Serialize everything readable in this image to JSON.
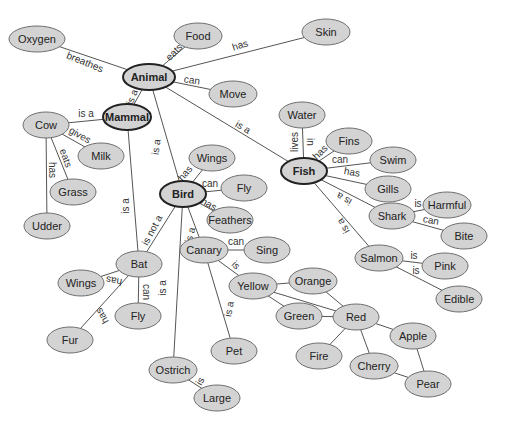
{
  "diagram": {
    "type": "concept-map",
    "colors": {
      "node_fill": "#d3d3d3",
      "node_stroke": "#6e6e6e",
      "main_stroke": "#222222",
      "edge": "#555555"
    },
    "nodes": [
      {
        "id": "oxygen",
        "label": "Oxygen",
        "x": 37,
        "y": 39,
        "rx": 28,
        "ry": 13
      },
      {
        "id": "food",
        "label": "Food",
        "x": 198,
        "y": 36,
        "rx": 24,
        "ry": 13
      },
      {
        "id": "skin",
        "label": "Skin",
        "x": 326,
        "y": 32,
        "rx": 24,
        "ry": 13
      },
      {
        "id": "animal",
        "label": "Animal",
        "x": 149,
        "y": 77,
        "rx": 26,
        "ry": 13,
        "main": true
      },
      {
        "id": "move",
        "label": "Move",
        "x": 233,
        "y": 94,
        "rx": 24,
        "ry": 13
      },
      {
        "id": "mammal",
        "label": "Mammal",
        "x": 127,
        "y": 117,
        "rx": 24,
        "ry": 13,
        "main": true
      },
      {
        "id": "cow",
        "label": "Cow",
        "x": 46,
        "y": 125,
        "rx": 23,
        "ry": 13
      },
      {
        "id": "milk",
        "label": "Milk",
        "x": 101,
        "y": 156,
        "rx": 23,
        "ry": 13
      },
      {
        "id": "grass",
        "label": "Grass",
        "x": 73,
        "y": 192,
        "rx": 23,
        "ry": 13
      },
      {
        "id": "udder",
        "label": "Udder",
        "x": 47,
        "y": 226,
        "rx": 23,
        "ry": 13
      },
      {
        "id": "water",
        "label": "Water",
        "x": 302,
        "y": 115,
        "rx": 23,
        "ry": 13
      },
      {
        "id": "fins",
        "label": "Fins",
        "x": 349,
        "y": 141,
        "rx": 23,
        "ry": 13
      },
      {
        "id": "swim",
        "label": "Swim",
        "x": 393,
        "y": 160,
        "rx": 23,
        "ry": 13
      },
      {
        "id": "fish",
        "label": "Fish",
        "x": 304,
        "y": 171,
        "rx": 23,
        "ry": 13,
        "main": true
      },
      {
        "id": "gills",
        "label": "Gills",
        "x": 388,
        "y": 189,
        "rx": 23,
        "ry": 13
      },
      {
        "id": "wings1",
        "label": "Wings",
        "x": 212,
        "y": 158,
        "rx": 23,
        "ry": 13
      },
      {
        "id": "fly1",
        "label": "Fly",
        "x": 244,
        "y": 188,
        "rx": 23,
        "ry": 13
      },
      {
        "id": "bird",
        "label": "Bird",
        "x": 183,
        "y": 194,
        "rx": 23,
        "ry": 13,
        "main": true
      },
      {
        "id": "feathers",
        "label": "Feathers",
        "x": 230,
        "y": 220,
        "rx": 23,
        "ry": 13
      },
      {
        "id": "harmful",
        "label": "Harmful",
        "x": 447,
        "y": 205,
        "rx": 24,
        "ry": 13
      },
      {
        "id": "shark",
        "label": "Shark",
        "x": 392,
        "y": 216,
        "rx": 23,
        "ry": 13
      },
      {
        "id": "bite",
        "label": "Bite",
        "x": 464,
        "y": 236,
        "rx": 23,
        "ry": 13
      },
      {
        "id": "canary",
        "label": "Canary",
        "x": 204,
        "y": 250,
        "rx": 24,
        "ry": 13
      },
      {
        "id": "sing",
        "label": "Sing",
        "x": 267,
        "y": 250,
        "rx": 23,
        "ry": 13
      },
      {
        "id": "salmon",
        "label": "Salmon",
        "x": 379,
        "y": 258,
        "rx": 24,
        "ry": 13
      },
      {
        "id": "pink",
        "label": "Pink",
        "x": 445,
        "y": 266,
        "rx": 23,
        "ry": 13
      },
      {
        "id": "edible",
        "label": "Edible",
        "x": 459,
        "y": 299,
        "rx": 23,
        "ry": 13
      },
      {
        "id": "bat",
        "label": "Bat",
        "x": 139,
        "y": 264,
        "rx": 23,
        "ry": 13
      },
      {
        "id": "wings2",
        "label": "Wings",
        "x": 81,
        "y": 283,
        "rx": 23,
        "ry": 13
      },
      {
        "id": "yellow",
        "label": "Yellow",
        "x": 253,
        "y": 286,
        "rx": 24,
        "ry": 13
      },
      {
        "id": "orange",
        "label": "Orange",
        "x": 313,
        "y": 281,
        "rx": 24,
        "ry": 13
      },
      {
        "id": "fly2",
        "label": "Fly",
        "x": 138,
        "y": 316,
        "rx": 23,
        "ry": 13
      },
      {
        "id": "green",
        "label": "Green",
        "x": 299,
        "y": 316,
        "rx": 23,
        "ry": 13
      },
      {
        "id": "red",
        "label": "Red",
        "x": 356,
        "y": 317,
        "rx": 23,
        "ry": 13
      },
      {
        "id": "apple",
        "label": "Apple",
        "x": 413,
        "y": 336,
        "rx": 23,
        "ry": 13
      },
      {
        "id": "fur",
        "label": "Fur",
        "x": 70,
        "y": 340,
        "rx": 23,
        "ry": 13
      },
      {
        "id": "pet",
        "label": "Pet",
        "x": 234,
        "y": 351,
        "rx": 23,
        "ry": 13
      },
      {
        "id": "fire",
        "label": "Fire",
        "x": 319,
        "y": 356,
        "rx": 23,
        "ry": 13
      },
      {
        "id": "cherry",
        "label": "Cherry",
        "x": 374,
        "y": 366,
        "rx": 24,
        "ry": 13
      },
      {
        "id": "ostrich",
        "label": "Ostrich",
        "x": 173,
        "y": 370,
        "rx": 24,
        "ry": 13
      },
      {
        "id": "pear",
        "label": "Pear",
        "x": 428,
        "y": 384,
        "rx": 23,
        "ry": 13
      },
      {
        "id": "large",
        "label": "Large",
        "x": 217,
        "y": 398,
        "rx": 23,
        "ry": 13
      }
    ],
    "edges": [
      {
        "from": "animal",
        "to": "oxygen",
        "label": "breathes",
        "lx": 85,
        "ly": 62,
        "rot": 22
      },
      {
        "from": "animal",
        "to": "food",
        "label": "eats",
        "lx": 174,
        "ly": 52,
        "rot": -45
      },
      {
        "from": "animal",
        "to": "skin",
        "label": "has",
        "lx": 240,
        "ly": 45,
        "rot": -18
      },
      {
        "from": "animal",
        "to": "move",
        "label": "can",
        "lx": 192,
        "ly": 80,
        "rot": 8
      },
      {
        "from": "animal",
        "to": "mammal",
        "label": "is a",
        "lx": 132,
        "ly": 97,
        "rot": -68
      },
      {
        "from": "animal",
        "to": "bird",
        "label": "is a",
        "lx": 156,
        "ly": 147,
        "rot": -82
      },
      {
        "from": "animal",
        "to": "fish",
        "label": "is a",
        "lx": 243,
        "ly": 127,
        "rot": 30
      },
      {
        "from": "mammal",
        "to": "cow",
        "label": "is a",
        "lx": 86,
        "ly": 113,
        "rot": 0
      },
      {
        "from": "cow",
        "to": "milk",
        "label": "gives",
        "lx": 80,
        "ly": 135,
        "rot": 30
      },
      {
        "from": "cow",
        "to": "grass",
        "label": "eats",
        "lx": 66,
        "ly": 158,
        "rot": 70
      },
      {
        "from": "cow",
        "to": "udder",
        "label": "has",
        "lx": 52,
        "ly": 170,
        "rot": 90
      },
      {
        "from": "mammal",
        "to": "bat",
        "label": "is a",
        "lx": 125,
        "ly": 206,
        "rot": -90
      },
      {
        "from": "bird",
        "to": "bat",
        "label": "is not a",
        "lx": 152,
        "ly": 230,
        "rot": -62
      },
      {
        "from": "bird",
        "to": "wings1",
        "label": "has",
        "lx": 185,
        "ly": 173,
        "rot": -50
      },
      {
        "from": "bird",
        "to": "fly1",
        "label": "can",
        "lx": 210,
        "ly": 183,
        "rot": 0
      },
      {
        "from": "bird",
        "to": "feathers",
        "label": "has",
        "lx": 209,
        "ly": 204,
        "rot": 30
      },
      {
        "from": "bird",
        "to": "canary",
        "label": "is a",
        "lx": 190,
        "ly": 235,
        "rot": -75
      },
      {
        "from": "bird",
        "to": "ostrich",
        "label": "is a",
        "lx": 162,
        "ly": 288,
        "rot": -90
      },
      {
        "from": "canary",
        "to": "sing",
        "label": "can",
        "lx": 236,
        "ly": 241,
        "rot": 0
      },
      {
        "from": "canary",
        "to": "yellow",
        "label": "is",
        "lx": 236,
        "ly": 265,
        "rot": 45
      },
      {
        "from": "canary",
        "to": "pet",
        "label": "is a",
        "lx": 229,
        "ly": 309,
        "rot": -80
      },
      {
        "from": "ostrich",
        "to": "large",
        "label": "is",
        "lx": 200,
        "ly": 381,
        "rot": -60
      },
      {
        "from": "bat",
        "to": "wings2",
        "label": "has",
        "lx": 114,
        "ly": 281,
        "rot": -170
      },
      {
        "from": "bat",
        "to": "fly2",
        "label": "can",
        "lx": 146,
        "ly": 292,
        "rot": 90
      },
      {
        "from": "bat",
        "to": "fur",
        "label": "has",
        "lx": 102,
        "ly": 316,
        "rot": -120
      },
      {
        "from": "fish",
        "to": "water",
        "label": "lives",
        "lx": 294,
        "ly": 142,
        "rot": -90
      },
      {
        "from": "fish",
        "to": "water",
        "label": "in",
        "lx": 310,
        "ly": 142,
        "rot": 90,
        "nolink": true
      },
      {
        "from": "fish",
        "to": "fins",
        "label": "has",
        "lx": 320,
        "ly": 152,
        "rot": -45
      },
      {
        "from": "fish",
        "to": "swim",
        "label": "can",
        "lx": 340,
        "ly": 159,
        "rot": 0
      },
      {
        "from": "fish",
        "to": "gills",
        "label": "has",
        "lx": 352,
        "ly": 172,
        "rot": 10
      },
      {
        "from": "fish",
        "to": "shark",
        "label": "is a",
        "lx": 344,
        "ly": 199,
        "rot": 210
      },
      {
        "from": "fish",
        "to": "salmon",
        "label": "is a",
        "lx": 343,
        "ly": 226,
        "rot": 240
      },
      {
        "from": "shark",
        "to": "harmful",
        "label": "is",
        "lx": 418,
        "ly": 203,
        "rot": 0
      },
      {
        "from": "shark",
        "to": "bite",
        "label": "can",
        "lx": 431,
        "ly": 220,
        "rot": 10
      },
      {
        "from": "salmon",
        "to": "pink",
        "label": "is",
        "lx": 414,
        "ly": 255,
        "rot": 0
      },
      {
        "from": "salmon",
        "to": "edible",
        "label": "is",
        "lx": 416,
        "ly": 270,
        "rot": 0
      },
      {
        "from": "yellow",
        "to": "orange",
        "label": ""
      },
      {
        "from": "yellow",
        "to": "green",
        "label": ""
      },
      {
        "from": "yellow",
        "to": "red",
        "label": ""
      },
      {
        "from": "orange",
        "to": "red",
        "label": ""
      },
      {
        "from": "green",
        "to": "red",
        "label": ""
      },
      {
        "from": "red",
        "to": "apple",
        "label": ""
      },
      {
        "from": "red",
        "to": "fire",
        "label": ""
      },
      {
        "from": "red",
        "to": "cherry",
        "label": ""
      },
      {
        "from": "apple",
        "to": "pear",
        "label": ""
      },
      {
        "from": "cherry",
        "to": "pear",
        "label": ""
      }
    ]
  }
}
